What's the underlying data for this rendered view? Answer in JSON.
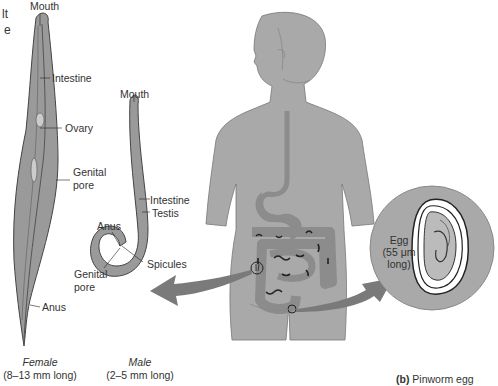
{
  "figure": {
    "partial_title_fragment": {
      "line1": "lt",
      "line2": "e"
    },
    "female": {
      "labels": {
        "mouth": "Mouth",
        "intestine": "Intestine",
        "ovary": "Ovary",
        "genital_pore_1": "Genital",
        "genital_pore_2": "pore",
        "anus": "Anus"
      },
      "caption_sex": "Female",
      "caption_size": "(8–13 mm long)"
    },
    "male": {
      "labels": {
        "mouth": "Mouth",
        "intestine": "Intestine",
        "testis": "Testis",
        "anus": "Anus",
        "genital_pore_1": "Genital",
        "genital_pore_2": "pore",
        "spicules": "Spicules"
      },
      "caption_sex": "Male",
      "caption_size": "(2–5 mm long)"
    },
    "egg": {
      "label_1": "Egg",
      "label_2": "(55 μm",
      "label_3": "long)"
    },
    "panel_caption": {
      "letter": "(b)",
      "text": " Pinworm egg"
    },
    "colors": {
      "body_gray": "#a9a9a9",
      "organ_gray": "#8c8c8c",
      "worm_gray": "#9a9a9a",
      "arrow_gray": "#7a7a7a",
      "outline": "#333333"
    }
  }
}
